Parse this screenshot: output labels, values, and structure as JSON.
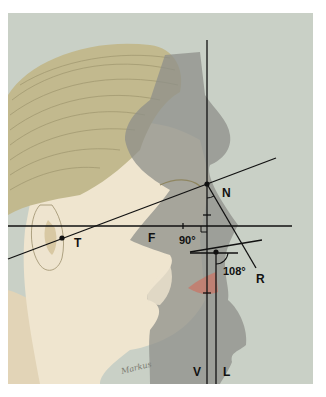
{
  "figure": {
    "colors": {
      "background_page": "#ffffff",
      "panel": "#c9d0c6",
      "hair": "#c2b98e",
      "hair_stroke": "#8f8660",
      "skin": "#efe5cf",
      "skin_shadow": "#d9c7a4",
      "silhouette": "#8d8f8a",
      "lip": "#c47a6c",
      "line": "#111111"
    },
    "labels": {
      "N": "N",
      "T": "T",
      "F": "F",
      "R": "R",
      "V": "V",
      "L": "L",
      "angle_90": "90°",
      "angle_108": "108°"
    },
    "signature": "Markus"
  }
}
